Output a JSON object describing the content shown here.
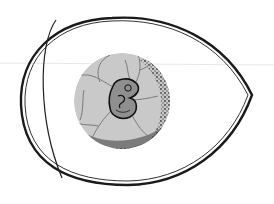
{
  "illustration": {
    "subject": "chick embryo inside egg",
    "background_color": "#ffffff",
    "shell_stroke_color": "#1a1a1a",
    "yolk_fill_color": "#c9c9c9",
    "vessel_color": "#7a7a7a",
    "stipple_color": "#2b2b2b",
    "embryo_fill_color": "#8f8f8f",
    "embryo_stroke_color": "#111111",
    "scan_line_color": "#e6e6e6"
  }
}
